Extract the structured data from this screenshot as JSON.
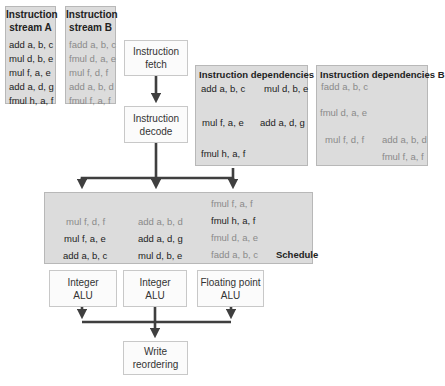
{
  "stream_a": {
    "title_line1": "Instruction",
    "title_line2": "stream A",
    "instructions": [
      "add a, b, c",
      "mul d, b, e",
      "mul f, a, e",
      "add a, d, g",
      "fmul h, a, f"
    ]
  },
  "stream_b": {
    "title_line1": "Instruction",
    "title_line2": "stream B",
    "instructions": [
      "fadd a, b, c",
      "fmul d, a, e",
      "mul f, d, f",
      "add a, b, d",
      "fmul f, a, f"
    ]
  },
  "fetch": {
    "line1": "Instruction",
    "line2": "fetch"
  },
  "decode": {
    "line1": "Instruction",
    "line2": "decode"
  },
  "deps_a": {
    "title": "Instruction dependencies A",
    "nodes": [
      "add a, b, c",
      "mul d, b, e",
      "mul f, a, e",
      "add a, d, g",
      "fmul h, a, f"
    ]
  },
  "deps_b": {
    "title": "Instruction dependencies B",
    "nodes": [
      "fadd a, b, c",
      "fmul d, a, e",
      "mul f, d, f",
      "add a, b, d",
      "fmul f, a, f"
    ]
  },
  "schedule": {
    "label": "Schedule",
    "col1": [
      "mul f, d, f",
      "mul f, a, e",
      "add a, b, c"
    ],
    "col2": [
      "add a, b, d",
      "add a, d, g",
      "mul d, b, e"
    ],
    "col3": [
      "fmul f, a, f",
      "fmul h, a, f",
      "fmul d, a, e",
      "fadd a, b, c"
    ]
  },
  "alu1": {
    "line1": "Integer",
    "line2": "ALU"
  },
  "alu2": {
    "line1": "Integer",
    "line2": "ALU"
  },
  "alu3": {
    "line1": "Floating point",
    "line2": "ALU"
  },
  "write": {
    "line1": "Write",
    "line2": "reordering"
  },
  "colors": {
    "box_gray": "#dcdcdc",
    "arrow": "#3f3f3f",
    "text_dark": "#222222",
    "text_light": "#8a8a8a"
  }
}
